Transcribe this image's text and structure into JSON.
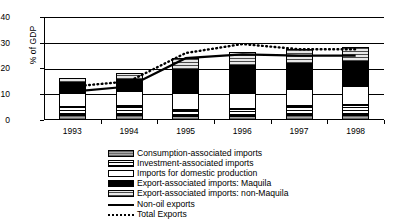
{
  "chart_data": {
    "type": "bar",
    "title": "",
    "subtitle": "",
    "xlabel": "",
    "ylabel": "% of GDP",
    "categories": [
      "1993",
      "1994",
      "1995",
      "1996",
      "1997",
      "1998"
    ],
    "ylim": [
      0,
      40
    ],
    "yticks": [
      0,
      10,
      20,
      30,
      40
    ],
    "grid": true,
    "legend_position": "bottom",
    "stacked": true,
    "series": [
      {
        "name": "Consumption-associated imports",
        "type": "bar",
        "values": [
          1.9,
          1.8,
          1.6,
          1.7,
          1.9,
          2.0
        ]
      },
      {
        "name": "Investment-associated imports",
        "type": "bar",
        "values": [
          3.0,
          3.5,
          2.4,
          2.7,
          3.7,
          4.0
        ]
      },
      {
        "name": "Imports for domestic production",
        "type": "bar",
        "values": [
          5.4,
          5.9,
          6.3,
          6.1,
          6.6,
          7.2
        ]
      },
      {
        "name": "Export-associated imports: Maquila",
        "type": "bar",
        "values": [
          4.1,
          4.5,
          9.2,
          10.3,
          9.6,
          9.4
        ]
      },
      {
        "name": "Export-associated imports: non-Maquila",
        "type": "bar",
        "values": [
          1.9,
          2.6,
          4.5,
          5.7,
          5.6,
          5.8
        ]
      },
      {
        "name": "Non-oil exports",
        "type": "line",
        "style": "solid",
        "values": [
          11.0,
          13.0,
          24.0,
          25.5,
          25.0,
          25.0
        ]
      },
      {
        "name": "Total Exports",
        "type": "line",
        "style": "dotted",
        "values": [
          13.0,
          15.0,
          26.0,
          29.5,
          27.5,
          27.5
        ]
      }
    ],
    "totals": [
      16.3,
      18.3,
      24.0,
      26.5,
      27.4,
      28.4
    ]
  },
  "legend": {
    "items": [
      {
        "label": "Consumption-associated imports",
        "swatch": "consumption"
      },
      {
        "label": "Investment-associated imports",
        "swatch": "investment"
      },
      {
        "label": "Imports for domestic production",
        "swatch": "domestic"
      },
      {
        "label": "Export-associated imports: Maquila",
        "swatch": "maquila"
      },
      {
        "label": "Export-associated imports: non-Maquila",
        "swatch": "nonmaquila"
      },
      {
        "label": "Non-oil exports",
        "swatch": "line-solid"
      },
      {
        "label": "Total Exports",
        "swatch": "line-dotted"
      }
    ]
  },
  "colors": {
    "axis": "#000000",
    "maquila": "#000000",
    "consumption": "#8a8a8a",
    "background": "#ffffff"
  }
}
